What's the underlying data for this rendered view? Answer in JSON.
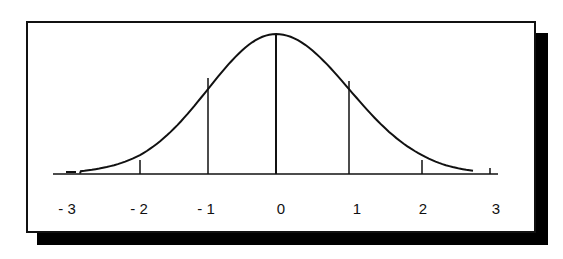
{
  "figure": {
    "type": "bell-curve",
    "x_axis": {
      "ticks": [
        -3,
        -2,
        -1,
        0,
        1,
        2,
        3
      ],
      "tick_labels": [
        "- 3",
        "- 2",
        "- 1",
        "0",
        "1",
        "2",
        "3"
      ]
    },
    "vertical_lines_at": [
      -2,
      -1,
      0,
      1,
      2
    ],
    "colors": {
      "line": "#111111",
      "shadow": "#000000",
      "background": "#ffffff"
    }
  },
  "chart_data": {
    "type": "line",
    "title": "",
    "xlabel": "",
    "ylabel": "",
    "x": [
      -3,
      -2.5,
      -2,
      -1.5,
      -1,
      -0.5,
      0,
      0.5,
      1,
      1.5,
      2,
      2.5,
      3
    ],
    "values": [
      0.004,
      0.018,
      0.054,
      0.13,
      0.242,
      0.352,
      0.399,
      0.352,
      0.242,
      0.13,
      0.054,
      0.018,
      0.004
    ],
    "tick_labels": [
      "- 3",
      "- 2",
      "- 1",
      "0",
      "1",
      "2",
      "3"
    ],
    "xlim": [
      -3.3,
      3.1
    ],
    "grid": false,
    "annotations": [
      "vertical lines at x = -2, -1, 0, 1, 2 from baseline to curve"
    ]
  }
}
